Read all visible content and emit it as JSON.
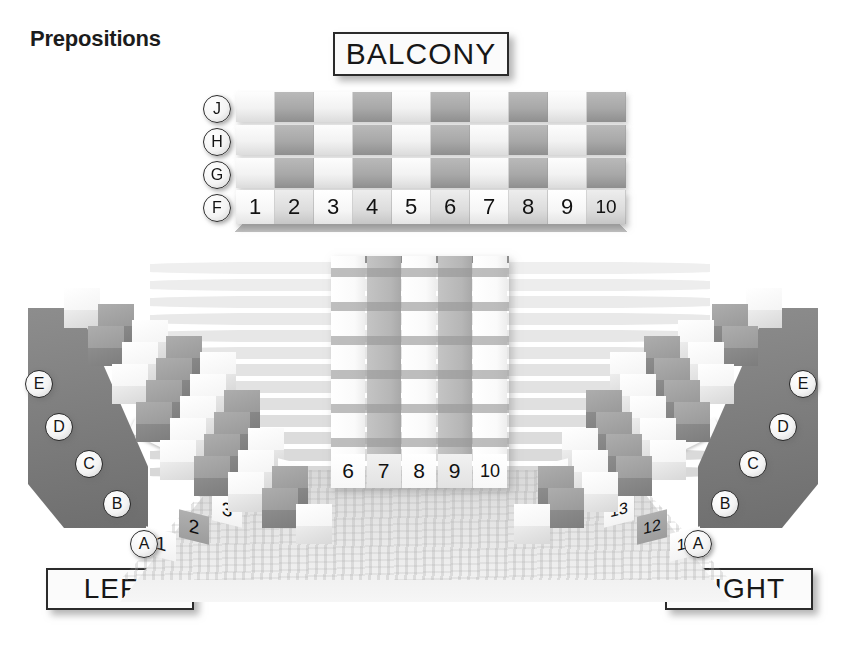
{
  "page": {
    "title": "Prepositions"
  },
  "labels": {
    "balcony": "BALCONY",
    "middle": "MIDDLE",
    "left": "LEFT",
    "right": "RIGHT"
  },
  "balcony_section": {
    "name": "balcony",
    "rows": [
      "J",
      "H",
      "G",
      "F"
    ],
    "seat_numbers": [
      "1",
      "2",
      "3",
      "4",
      "5",
      "6",
      "7",
      "8",
      "9",
      "10"
    ],
    "numbered_row": "F"
  },
  "middle_section": {
    "name": "middle",
    "seat_numbers": [
      "6",
      "7",
      "8",
      "9",
      "10"
    ]
  },
  "left_section": {
    "name": "left",
    "rows": [
      "E",
      "D",
      "C",
      "B",
      "A"
    ],
    "seat_numbers": [
      "1",
      "2",
      "3",
      "4",
      "5"
    ]
  },
  "right_section": {
    "name": "right",
    "rows": [
      "E",
      "D",
      "C",
      "B",
      "A"
    ],
    "seat_numbers": [
      "11",
      "12",
      "13",
      "14",
      "15"
    ]
  },
  "colors": {
    "ink": "#171717",
    "seat_light": "#f4f4f4",
    "seat_dark": "#9a9a9a",
    "backdrop_stripe": "#c9c9c9",
    "floor": "#e0e0e0"
  }
}
